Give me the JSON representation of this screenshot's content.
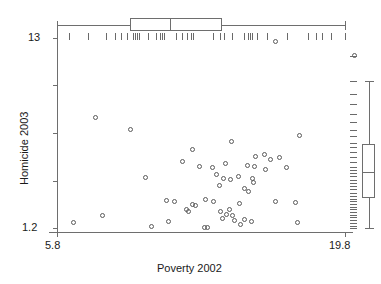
{
  "chart_data": {
    "type": "scatter",
    "title": "",
    "xlabel": "Poverty 2002",
    "ylabel": "Homicide 2003",
    "xticklabels": [
      "5.8",
      "19.8"
    ],
    "yticklabels": [
      "1.2",
      "13"
    ],
    "xlim": [
      5.8,
      19.8
    ],
    "ylim": [
      1.2,
      13.0
    ],
    "grid": false,
    "legend": "none",
    "marginal_plots": {
      "top": {
        "type": "boxplot-with-rug",
        "orientation": "horizontal",
        "variable": "Poverty 2002",
        "whisker_low": 5.8,
        "q1": 9.35,
        "median": 11.3,
        "q3": 13.8,
        "whisker_high": 19.8,
        "outliers": [],
        "rug_values": [
          5.8,
          6.4,
          7.3,
          8.2,
          8.6,
          8.9,
          9.2,
          9.5,
          9.6,
          9.7,
          9.8,
          10.2,
          10.6,
          10.8,
          10.9,
          11.0,
          11.6,
          11.9,
          12.1,
          12.3,
          12.4,
          13.4,
          13.7,
          13.9,
          14.3,
          14.9,
          15.1,
          15.2,
          15.3,
          15.5,
          16.0,
          17.0,
          18.0,
          18.4,
          18.7,
          19.1,
          19.8
        ]
      },
      "right": {
        "type": "boxplot-with-rug",
        "orientation": "vertical",
        "variable": "Homicide 2003",
        "whisker_low": 1.2,
        "q1": 3.05,
        "median": 4.7,
        "q3": 6.4,
        "whisker_high": 10.3,
        "outliers": [
          11.9
        ],
        "rug_values": [
          1.2,
          1.3,
          1.5,
          1.7,
          1.9,
          2.0,
          2.2,
          2.4,
          2.5,
          2.7,
          2.9,
          3.0,
          3.2,
          3.4,
          3.6,
          3.8,
          4.0,
          4.2,
          4.4,
          4.6,
          4.8,
          5.0,
          5.3,
          5.6,
          5.9,
          6.2,
          6.5,
          6.9,
          7.3,
          7.8,
          8.3,
          8.9,
          9.5,
          10.3,
          11.9
        ]
      }
    },
    "annotations": [
      {
        "name": "top-rug-outlier-marker",
        "axis": "x",
        "value": 16.4
      }
    ],
    "points": [
      {
        "x": 7.65,
        "y": 8.05
      },
      {
        "x": 9.35,
        "y": 7.3
      },
      {
        "x": 12.4,
        "y": 6.1
      },
      {
        "x": 14.3,
        "y": 6.55
      },
      {
        "x": 15.45,
        "y": 5.65
      },
      {
        "x": 11.9,
        "y": 5.3
      },
      {
        "x": 12.75,
        "y": 5.0
      },
      {
        "x": 13.35,
        "y": 4.95
      },
      {
        "x": 14.0,
        "y": 5.2
      },
      {
        "x": 13.55,
        "y": 4.55
      },
      {
        "x": 13.9,
        "y": 4.3
      },
      {
        "x": 14.25,
        "y": 4.2
      },
      {
        "x": 10.1,
        "y": 4.35
      },
      {
        "x": 13.7,
        "y": 3.85
      },
      {
        "x": 16.6,
        "y": 5.55
      },
      {
        "x": 17.6,
        "y": 6.95
      },
      {
        "x": 15.9,
        "y": 5.75
      },
      {
        "x": 16.2,
        "y": 5.45
      },
      {
        "x": 15.05,
        "y": 5.1
      },
      {
        "x": 15.4,
        "y": 5.0
      },
      {
        "x": 15.95,
        "y": 4.85
      },
      {
        "x": 16.95,
        "y": 4.95
      },
      {
        "x": 14.6,
        "y": 4.4
      },
      {
        "x": 15.3,
        "y": 4.3
      },
      {
        "x": 15.35,
        "y": 4.05
      },
      {
        "x": 14.9,
        "y": 3.65
      },
      {
        "x": 15.1,
        "y": 3.45
      },
      {
        "x": 14.65,
        "y": 2.75
      },
      {
        "x": 17.4,
        "y": 2.8
      },
      {
        "x": 11.1,
        "y": 2.9
      },
      {
        "x": 11.5,
        "y": 2.85
      },
      {
        "x": 12.4,
        "y": 2.65
      },
      {
        "x": 12.55,
        "y": 2.6
      },
      {
        "x": 13.0,
        "y": 2.95
      },
      {
        "x": 13.4,
        "y": 2.85
      },
      {
        "x": 16.4,
        "y": 2.85
      },
      {
        "x": 12.1,
        "y": 2.35
      },
      {
        "x": 12.2,
        "y": 2.25
      },
      {
        "x": 13.75,
        "y": 2.2
      },
      {
        "x": 14.05,
        "y": 2.05
      },
      {
        "x": 14.2,
        "y": 2.35
      },
      {
        "x": 13.85,
        "y": 1.8
      },
      {
        "x": 14.35,
        "y": 1.95
      },
      {
        "x": 14.45,
        "y": 1.65
      },
      {
        "x": 14.9,
        "y": 1.75
      },
      {
        "x": 15.25,
        "y": 1.6
      },
      {
        "x": 14.7,
        "y": 1.4
      },
      {
        "x": 17.5,
        "y": 1.55
      },
      {
        "x": 8.0,
        "y": 1.95
      },
      {
        "x": 6.6,
        "y": 1.55
      },
      {
        "x": 11.2,
        "y": 1.6
      },
      {
        "x": 10.4,
        "y": 1.3
      },
      {
        "x": 12.95,
        "y": 1.25
      },
      {
        "x": 13.1,
        "y": 1.22
      }
    ]
  },
  "geometry": {
    "plot_left": 57,
    "plot_right": 345,
    "plot_top": 46,
    "plot_bottom": 232,
    "y_top_value": 13.0,
    "y_top_px": 38,
    "y_bottom_value": 1.2,
    "y_bottom_px": 228,
    "top_box_y": 18,
    "top_box_h": 13,
    "top_rug_y": 33,
    "right_box_x": 362,
    "right_box_w": 13,
    "right_rug_x": 350
  }
}
